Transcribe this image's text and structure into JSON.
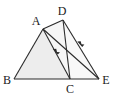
{
  "figure": {
    "width": 116,
    "height": 97,
    "background_color": "#ffffff",
    "stroke_color": "#2b2b2b",
    "shade_color": "#ededed",
    "shade_color_secondary": "#f2f2f2",
    "points": {
      "A": {
        "label": "A",
        "x": 43,
        "y": 29,
        "label_x": 36,
        "label_y": 25
      },
      "B": {
        "label": "B",
        "x": 14,
        "y": 79,
        "label_x": 3,
        "label_y": 84
      },
      "C": {
        "label": "C",
        "x": 70,
        "y": 79,
        "label_x": 66,
        "label_y": 93
      },
      "D": {
        "label": "D",
        "x": 63,
        "y": 20,
        "label_x": 58,
        "label_y": 16
      },
      "E": {
        "label": "E",
        "x": 99,
        "y": 79,
        "label_x": 101,
        "label_y": 84
      }
    },
    "segments": [
      {
        "name": "AB",
        "from": "A",
        "to": "B"
      },
      {
        "name": "BE",
        "from": "B",
        "to": "E"
      },
      {
        "name": "AC",
        "from": "A",
        "to": "C"
      },
      {
        "name": "AD",
        "from": "A",
        "to": "D"
      },
      {
        "name": "AE",
        "from": "A",
        "to": "E"
      },
      {
        "name": "DC",
        "from": "D",
        "to": "C"
      },
      {
        "name": "DE",
        "from": "D",
        "to": "E"
      }
    ],
    "shaded_regions": [
      {
        "name": "triangle-ABC",
        "vertices": [
          "A",
          "B",
          "C"
        ],
        "fill": "#ededed"
      },
      {
        "name": "triangle-DCE-strip",
        "vertices": [
          "D",
          "C",
          "E"
        ],
        "fill": "#f7f7f7"
      }
    ],
    "arrow_marks": [
      {
        "name": "arrow-on-AC",
        "on_segment": "AC",
        "x": 57,
        "y": 53,
        "direction": "toward-C"
      },
      {
        "name": "arrow-on-DE",
        "on_segment": "DE",
        "x": 81,
        "y": 45,
        "direction": "toward-E"
      }
    ]
  }
}
